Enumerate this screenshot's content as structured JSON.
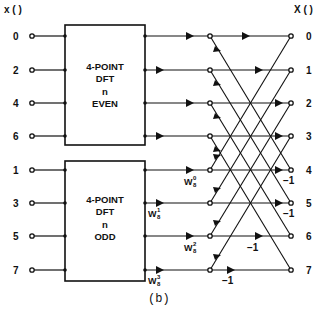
{
  "input_header": "x ( )",
  "output_header": "X ( )",
  "inputs": [
    "0",
    "2",
    "4",
    "6",
    "1",
    "3",
    "5",
    "7"
  ],
  "outputs": [
    "0",
    "1",
    "2",
    "3",
    "4",
    "5",
    "6",
    "7"
  ],
  "even_box": {
    "line1": "4-POINT",
    "line2": "DFT",
    "line3": "n",
    "line4": "EVEN"
  },
  "odd_box": {
    "line1": "4-POINT",
    "line2": "DFT",
    "line3": "n",
    "line4": "ODD"
  },
  "twiddles": [
    {
      "base": "W",
      "sup": "0",
      "sub": "8"
    },
    {
      "base": "W",
      "sup": "1",
      "sub": "8"
    },
    {
      "base": "W",
      "sup": "2",
      "sub": "8"
    },
    {
      "base": "W",
      "sup": "3",
      "sub": "8"
    }
  ],
  "minus_one": [
    "−1",
    "−1",
    "−1",
    "−1"
  ],
  "caption": "(b)"
}
